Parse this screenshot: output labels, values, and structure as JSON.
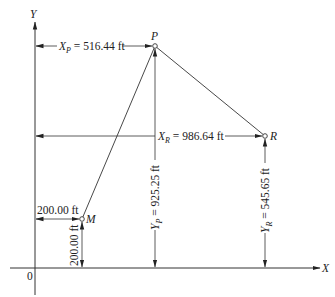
{
  "diagram": {
    "axes": {
      "x_label": "X",
      "y_label": "Y",
      "origin_label": "0"
    },
    "points": {
      "P": {
        "label": "P",
        "x_ft": 516.44,
        "y_ft": 925.25
      },
      "R": {
        "label": "R",
        "x_ft": 986.64,
        "y_ft": 545.65
      },
      "M": {
        "label": "M",
        "x_ft": 200.0,
        "y_ft": 200.0
      }
    },
    "dimensions": {
      "xp": {
        "var": "X",
        "sub": "P",
        "text": " = 516.44 ft"
      },
      "xr": {
        "var": "X",
        "sub": "R",
        "text": " = 986.64 ft"
      },
      "yp": {
        "var": "Y",
        "sub": "P",
        "text": " = 925.25 ft"
      },
      "yr": {
        "var": "Y",
        "sub": "R",
        "text": " = 545.65 ft"
      },
      "xm": {
        "text": "200.00 ft"
      },
      "ym": {
        "text": "200.00 ft"
      }
    },
    "colors": {
      "line": "#333333",
      "text": "#222222",
      "background": "#ffffff"
    }
  }
}
